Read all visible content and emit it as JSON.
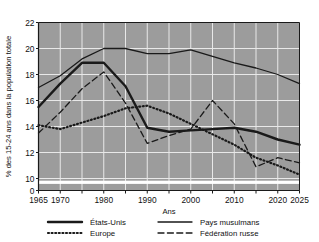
{
  "figure": {
    "clipped_top_caption": "",
    "background_color": "#ffffff",
    "plot_background_color": "#9c9c9c",
    "gridline_color": "#e8e8e8",
    "axis_color": "#1a1a1a",
    "series_color": "#1a1a1a"
  },
  "chart_data": {
    "type": "line",
    "title": "",
    "xlabel": "Ans",
    "ylabel": "% des 15-24 ans dans la population totale",
    "xlim": [
      1965,
      2025
    ],
    "ylim": [
      10,
      22
    ],
    "y_axis_break_at_zero": true,
    "grid": true,
    "legend_position": "bottom",
    "ytick_labels": [
      "22",
      "20",
      "18",
      "16",
      "14",
      "12",
      "10",
      "0"
    ],
    "yticks": [
      22,
      20,
      18,
      16,
      14,
      12,
      10,
      0
    ],
    "xtick_labels": [
      "1965",
      "1970",
      "1980",
      "1990",
      "2000",
      "2010",
      "2020",
      "2025"
    ],
    "xticks": [
      1965,
      1970,
      1980,
      1990,
      2000,
      2010,
      2020,
      2025
    ],
    "xgrid_minor_step_years": 5,
    "x": [
      1965,
      1970,
      1975,
      1980,
      1985,
      1990,
      1995,
      2000,
      2005,
      2010,
      2015,
      2020,
      2025
    ],
    "series": [
      {
        "name": "États-Unis",
        "style": "solid-thick",
        "linewidth": 2.4,
        "dash": "none",
        "values": [
          15.5,
          17.3,
          18.9,
          18.9,
          17.1,
          13.9,
          13.6,
          13.7,
          13.8,
          13.9,
          13.6,
          13.0,
          12.6
        ]
      },
      {
        "name": "Pays musulmans",
        "style": "solid-thin",
        "linewidth": 1.3,
        "dash": "none",
        "values": [
          17.0,
          17.9,
          19.2,
          20.0,
          20.0,
          19.6,
          19.6,
          19.9,
          19.4,
          18.9,
          18.5,
          18.0,
          17.3
        ]
      },
      {
        "name": "Europe",
        "style": "dotted",
        "linewidth": 2.2,
        "dash": "1,2.6",
        "values": [
          14.1,
          13.8,
          14.3,
          14.8,
          15.4,
          15.6,
          15.0,
          14.2,
          13.4,
          12.6,
          11.6,
          11.0,
          10.3
        ]
      },
      {
        "name": "Fédération russe",
        "style": "dashed",
        "linewidth": 1.3,
        "dash": "6,3.4",
        "values": [
          13.5,
          15.1,
          16.9,
          18.2,
          15.8,
          12.7,
          13.3,
          13.8,
          16.0,
          14.2,
          10.9,
          11.6,
          11.2
        ]
      }
    ],
    "legend": [
      {
        "label": "États-Unis",
        "style": "solid-thick"
      },
      {
        "label": "Pays musulmans",
        "style": "solid-thin"
      },
      {
        "label": "Europe",
        "style": "dotted"
      },
      {
        "label": "Fédération russe",
        "style": "dashed"
      }
    ]
  }
}
